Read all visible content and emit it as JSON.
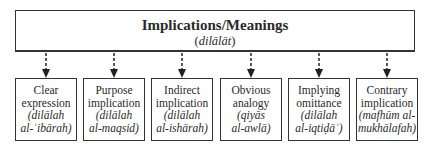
{
  "top": {
    "title": "Implications/Meanings",
    "subtitle_open": "(",
    "subtitle_term": "dilālāt",
    "subtitle_close": ")"
  },
  "children": [
    {
      "label_1": "Clear",
      "label_2": "expression",
      "term_1": "(dilālah",
      "term_2": "al-ʿibārah)"
    },
    {
      "label_1": "Purpose",
      "label_2": "implication",
      "term_1": "(dilālah",
      "term_2": "al-maqsid)"
    },
    {
      "label_1": "Indirect",
      "label_2": "implication",
      "term_1": "(dilālah",
      "term_2": "al-ishārah)"
    },
    {
      "label_1": "Obvious",
      "label_2": "analogy",
      "term_1": "(qiyās",
      "term_2": "al-awlā)"
    },
    {
      "label_1": "Implying",
      "label_2": "omittance",
      "term_1": "(dilālah",
      "term_2": "al-iqtiḍāʾ)"
    },
    {
      "label_1": "Contrary",
      "label_2": "implication",
      "term_1": "(mafhūm al-",
      "term_2": "mukhālafah)"
    }
  ]
}
